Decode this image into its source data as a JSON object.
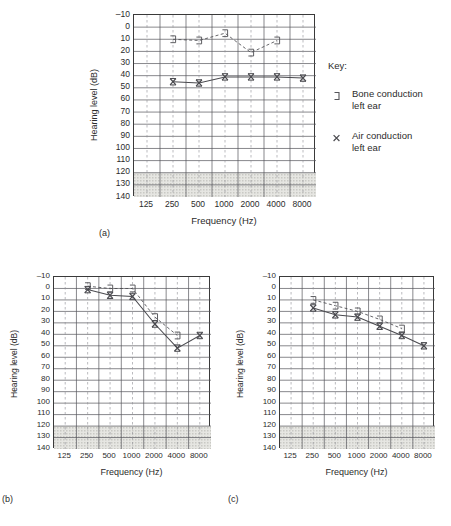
{
  "figure": {
    "axis": {
      "ylabel": "Hearing level (dB)",
      "xlabel": "Frequency (Hz)",
      "yticks": [
        "-10",
        "0",
        "10",
        "20",
        "30",
        "40",
        "50",
        "60",
        "70",
        "80",
        "90",
        "100",
        "110",
        "120",
        "130",
        "140"
      ],
      "xticks": [
        "125",
        "250",
        "500",
        "1000",
        "2000",
        "4000",
        "8000"
      ],
      "ymin": -10,
      "ymax": 140,
      "shaded_from": 120,
      "shaded_to": 140
    },
    "panels": [
      {
        "letter": "(a)"
      },
      {
        "letter": "(b)"
      },
      {
        "letter": "(c)"
      }
    ]
  },
  "legend": {
    "title": "Key:",
    "items": [
      {
        "symbol": "bone-conduction-bracket",
        "line1": "Bone conduction",
        "line2": "left ear"
      },
      {
        "symbol": "air-conduction-cross",
        "line1": "Air conduction",
        "line2": "left ear"
      }
    ]
  },
  "colors": {
    "ink": "#2b2b2b",
    "frame": "#3a3a3a",
    "grid_solid": "#55555a",
    "grid_dashed": "#8d8d93",
    "shade": "#c9c9c4",
    "trace": "#4a4a4f"
  },
  "chart_data": [
    {
      "type": "line",
      "title": "(a)",
      "xlabel": "Frequency (Hz)",
      "ylabel": "Hearing level (dB)",
      "x": [
        125,
        250,
        500,
        1000,
        2000,
        4000,
        8000
      ],
      "xscale": "log-octave",
      "ylim": [
        -10,
        140
      ],
      "y_inverted": false,
      "grid": true,
      "legend": "external",
      "shaded_band": [
        120,
        140
      ],
      "series": [
        {
          "name": "Bone conduction left ear",
          "symbol": "bracket",
          "linestyle": "dashed",
          "x": [
            250,
            500,
            1000,
            2000,
            4000
          ],
          "values": [
            10,
            11,
            5,
            21,
            11
          ]
        },
        {
          "name": "Air conduction left ear",
          "symbol": "cross",
          "linestyle": "solid",
          "x": [
            250,
            500,
            1000,
            2000,
            4000,
            8000
          ],
          "values": [
            45,
            46,
            41,
            41,
            41,
            42
          ]
        }
      ]
    },
    {
      "type": "line",
      "title": "(b)",
      "xlabel": "Frequency (Hz)",
      "ylabel": "Hearing level (dB)",
      "x": [
        125,
        250,
        500,
        1000,
        2000,
        4000,
        8000
      ],
      "xscale": "log-octave",
      "ylim": [
        -10,
        140
      ],
      "grid": true,
      "shaded_band": [
        120,
        140
      ],
      "series": [
        {
          "name": "Bone conduction left ear",
          "symbol": "bracket",
          "linestyle": "dashed",
          "x": [
            250,
            500,
            1000,
            2000,
            4000
          ],
          "values": [
            -2,
            0,
            0,
            25,
            41
          ]
        },
        {
          "name": "Air conduction left ear",
          "symbol": "cross",
          "linestyle": "solid",
          "x": [
            250,
            500,
            1000,
            2000,
            4000,
            8000
          ],
          "values": [
            1,
            6,
            7,
            31,
            52,
            41
          ]
        }
      ]
    },
    {
      "type": "line",
      "title": "(c)",
      "xlabel": "Frequency (Hz)",
      "ylabel": "Hearing level (dB)",
      "x": [
        125,
        250,
        500,
        1000,
        2000,
        4000,
        8000
      ],
      "xscale": "log-octave",
      "ylim": [
        -10,
        140
      ],
      "grid": true,
      "shaded_band": [
        120,
        140
      ],
      "series": [
        {
          "name": "Bone conduction left ear",
          "symbol": "bracket",
          "linestyle": "dashed",
          "x": [
            250,
            500,
            1000,
            2000,
            4000
          ],
          "values": [
            10,
            15,
            20,
            27,
            35
          ]
        },
        {
          "name": "Air conduction left ear",
          "symbol": "cross",
          "linestyle": "solid",
          "x": [
            250,
            500,
            1000,
            2000,
            4000,
            8000
          ],
          "values": [
            17,
            23,
            25,
            33,
            41,
            50
          ]
        }
      ]
    }
  ]
}
